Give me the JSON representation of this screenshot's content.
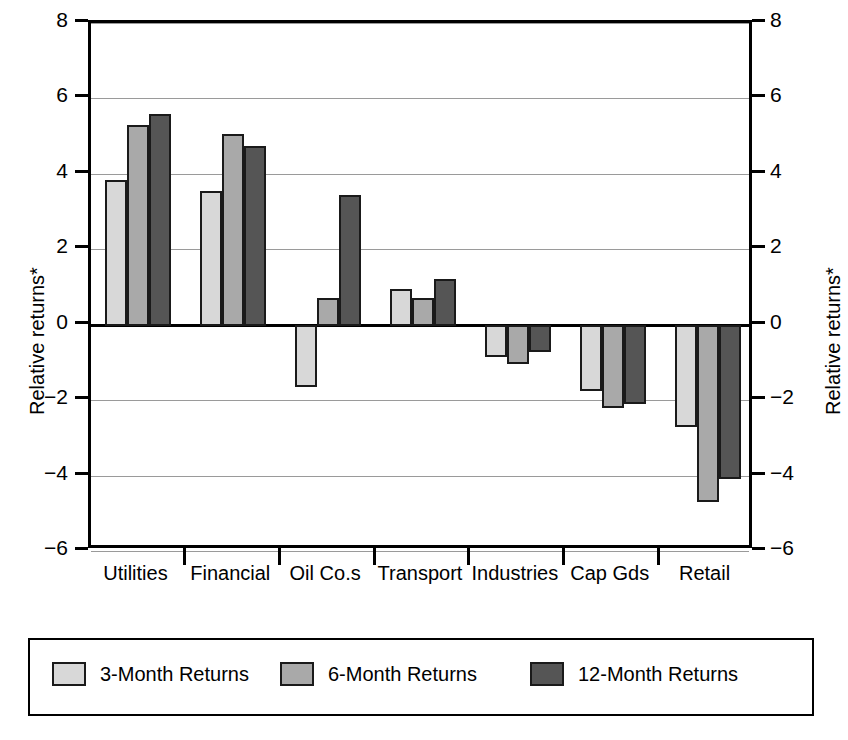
{
  "chart_data": {
    "type": "bar",
    "title": "",
    "subtitle": "",
    "xlabel": "",
    "ylabel": "Relative returns*",
    "ylabel_right": "Relative returns*",
    "ylim": [
      -6,
      8
    ],
    "yticks": [
      8,
      6,
      4,
      2,
      0,
      -2,
      -4,
      -6
    ],
    "ytick_labels": [
      "8",
      "6",
      "4",
      "2",
      "0",
      "−2",
      "−4",
      "−6"
    ],
    "grid": true,
    "grid_axis": "y",
    "legend_position": "bottom",
    "dual_axis": true,
    "categories": [
      "Utilities",
      "Financial",
      "Oil Co.s",
      "Transport",
      "Industries",
      "Cap Gds",
      "Retail"
    ],
    "series": [
      {
        "name": "3-Month Returns",
        "color": "#d8d8d8",
        "values": [
          3.85,
          3.55,
          -1.65,
          0.95,
          -0.85,
          -1.75,
          -2.7
        ]
      },
      {
        "name": "6-Month Returns",
        "color": "#a9a9a9",
        "values": [
          5.3,
          5.05,
          0.72,
          0.72,
          -1.05,
          -2.2,
          -4.7
        ]
      },
      {
        "name": "12-Month Returns",
        "color": "#555555",
        "values": [
          5.6,
          4.75,
          3.45,
          1.2,
          -0.72,
          -2.1,
          -4.1
        ]
      }
    ],
    "annotations": [
      "*"
    ]
  },
  "legend": {
    "items": [
      {
        "label": "3-Month Returns",
        "color": "#d8d8d8"
      },
      {
        "label": "6-Month Returns",
        "color": "#a9a9a9"
      },
      {
        "label": "12-Month Returns",
        "color": "#555555"
      }
    ]
  }
}
